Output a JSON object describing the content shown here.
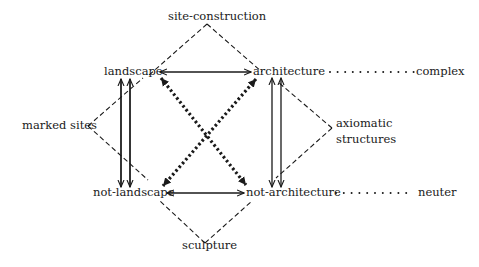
{
  "diagram": {
    "type": "semiotic-square",
    "colors": {
      "ink": "#1a1a1a",
      "background": "#ffffff"
    },
    "nodes": {
      "site_construction": "site-construction",
      "landscape": "landscape",
      "architecture": "architecture",
      "complex": "complex",
      "marked_sites": "marked sites",
      "axiomatic": "axiomatic",
      "structures": "structures",
      "not_landscape": "not-landscape",
      "not_architecture": "not-architecture",
      "neuter": "neuter",
      "sculpture": "sculpture"
    },
    "edges": [
      {
        "from": "landscape",
        "to": "architecture",
        "style": "solid",
        "arrows": "both"
      },
      {
        "from": "not-landscape",
        "to": "not-architecture",
        "style": "solid",
        "arrows": "both"
      },
      {
        "from": "landscape",
        "to": "not-landscape",
        "style": "solid-double",
        "arrows": "both"
      },
      {
        "from": "architecture",
        "to": "not-architecture",
        "style": "solid-double",
        "arrows": "both"
      },
      {
        "from": "landscape",
        "to": "not-architecture",
        "style": "heavy-dotted",
        "arrows": "both"
      },
      {
        "from": "architecture",
        "to": "not-landscape",
        "style": "heavy-dotted",
        "arrows": "both"
      },
      {
        "from": "architecture",
        "to": "complex",
        "style": "dotted",
        "arrows": "none"
      },
      {
        "from": "not-architecture",
        "to": "neuter",
        "style": "dotted",
        "arrows": "none"
      },
      {
        "from": "site-construction",
        "to": "landscape",
        "style": "dashed"
      },
      {
        "from": "site-construction",
        "to": "architecture",
        "style": "dashed"
      },
      {
        "from": "marked sites",
        "to": "landscape",
        "style": "dashed"
      },
      {
        "from": "marked sites",
        "to": "not-landscape",
        "style": "dashed"
      },
      {
        "from": "axiomatic structures",
        "to": "architecture",
        "style": "dashed"
      },
      {
        "from": "axiomatic structures",
        "to": "not-architecture",
        "style": "dashed"
      },
      {
        "from": "sculpture",
        "to": "not-landscape",
        "style": "dashed"
      },
      {
        "from": "sculpture",
        "to": "not-architecture",
        "style": "dashed"
      }
    ]
  }
}
